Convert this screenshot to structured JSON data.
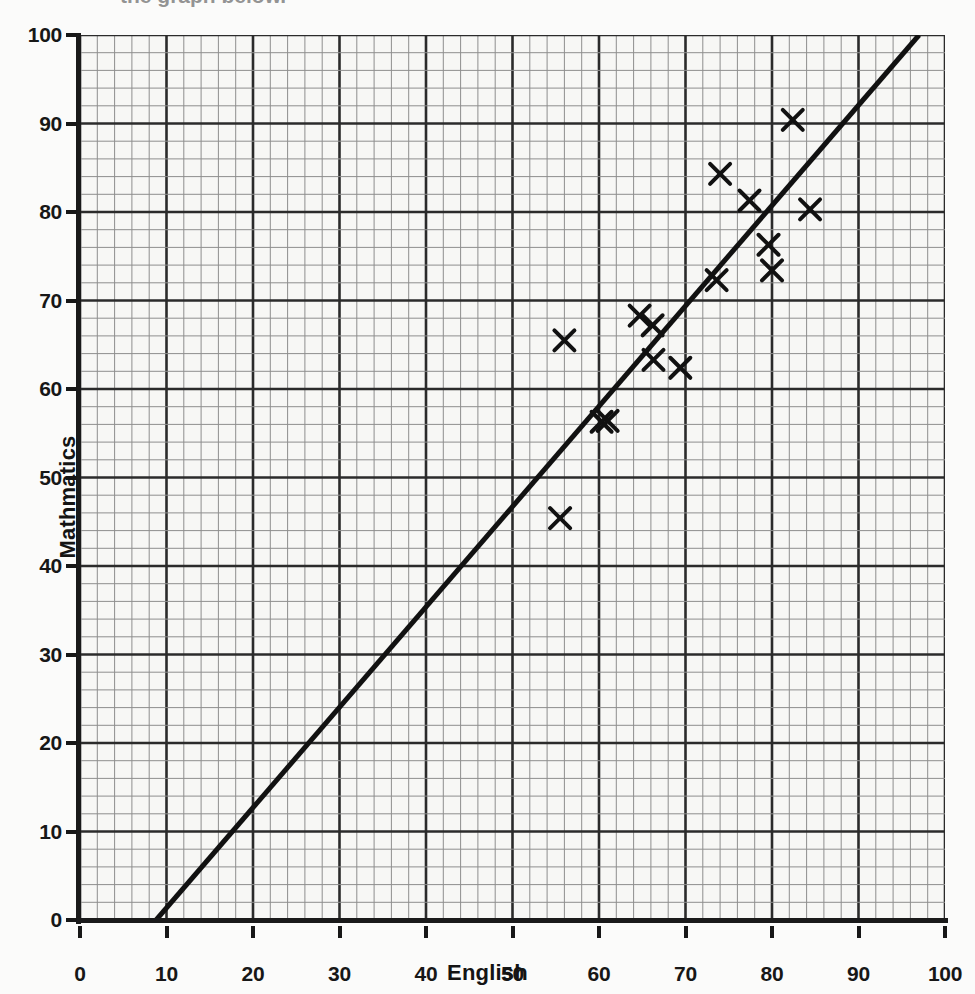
{
  "figure": {
    "header_fragment": "the graph below.",
    "background_color": "#fbfbfa",
    "ink_color": "#1a1a1a"
  },
  "axes": {
    "x_title": "English",
    "y_title": "Mathmatics",
    "x_ticks": [
      "0",
      "10",
      "20",
      "30",
      "40",
      "50",
      "60",
      "70",
      "80",
      "90",
      "100"
    ],
    "y_ticks": [
      "0",
      "10",
      "20",
      "30",
      "40",
      "50",
      "60",
      "70",
      "80",
      "90",
      "100"
    ]
  },
  "chart_data": {
    "type": "scatter",
    "title": "",
    "subtitle": "",
    "xlabel": "English",
    "ylabel": "Mathmatics",
    "xlim": [
      0,
      100
    ],
    "ylim": [
      0,
      100
    ],
    "x_tick_step": 10,
    "y_tick_step": 10,
    "grid": true,
    "grid_minor_step": 2,
    "grid_major_step": 10,
    "grid_style": "graph-paper",
    "legend": false,
    "legend_position": "none",
    "marker": "x",
    "marker_color": "#111111",
    "series": [
      {
        "name": "Students",
        "type": "scatter",
        "points": [
          {
            "x": 55.5,
            "y": 45.4
          },
          {
            "x": 56.0,
            "y": 65.5
          },
          {
            "x": 60.3,
            "y": 56.3
          },
          {
            "x": 61.0,
            "y": 56.4
          },
          {
            "x": 64.7,
            "y": 68.3
          },
          {
            "x": 66.2,
            "y": 67.2
          },
          {
            "x": 66.3,
            "y": 63.3
          },
          {
            "x": 69.4,
            "y": 62.4
          },
          {
            "x": 73.6,
            "y": 72.3
          },
          {
            "x": 74.0,
            "y": 84.3
          },
          {
            "x": 77.4,
            "y": 81.3
          },
          {
            "x": 79.6,
            "y": 76.3
          },
          {
            "x": 80.0,
            "y": 73.4
          },
          {
            "x": 82.4,
            "y": 90.4
          },
          {
            "x": 84.4,
            "y": 80.3
          }
        ]
      },
      {
        "name": "Line of best fit",
        "type": "line",
        "start": {
          "x": 8.8,
          "y": 0
        },
        "end": {
          "x": 97.0,
          "y": 100
        },
        "color": "#111111",
        "width_px": 5
      }
    ]
  }
}
